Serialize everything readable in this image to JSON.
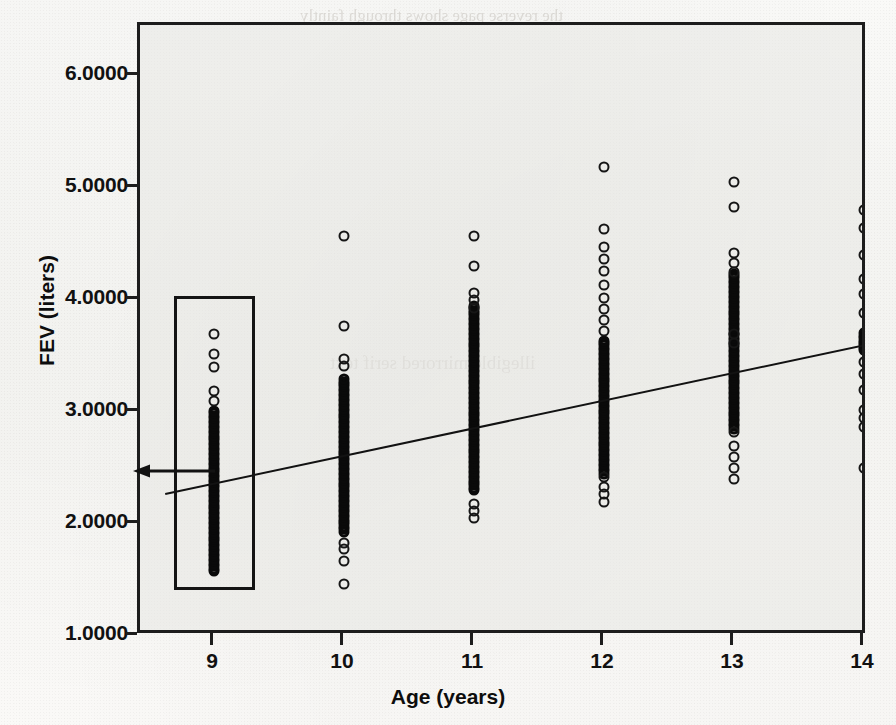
{
  "figure": {
    "kind": "scanned-textbook-figure",
    "background_bleed_text": [
      "the reverse page shows through faintly",
      "illegible mirrored serif text"
    ]
  },
  "axes": {
    "y_title": "FEV (liters)",
    "x_title": "Age (years)",
    "y_ticks": [
      "1.0000",
      "2.0000",
      "3.0000",
      "4.0000",
      "5.0000",
      "6.0000"
    ],
    "x_ticks": [
      "9",
      "10",
      "11",
      "12",
      "13",
      "14"
    ]
  },
  "annotation": {
    "box_label": "age-9-highlight-box",
    "arrow_label": "fitted-value-arrow",
    "arrow_points_to_value": "2.45"
  },
  "chart_data": {
    "type": "scatter",
    "title": "",
    "xlabel": "Age (years)",
    "ylabel": "FEV (liters)",
    "xlim": [
      8.55,
      14.45
    ],
    "ylim": [
      1.0,
      6.45
    ],
    "xticks": [
      9,
      10,
      11,
      12,
      13,
      14
    ],
    "yticks": [
      1.0,
      2.0,
      3.0,
      4.0,
      5.0,
      6.0
    ],
    "ytick_labels": [
      "1.0000",
      "2.0000",
      "3.0000",
      "4.0000",
      "5.0000",
      "6.0000"
    ],
    "xtick_labels": [
      "9",
      "10",
      "11",
      "12",
      "13",
      "14"
    ],
    "grid": false,
    "legend": null,
    "marker": "open-circle",
    "note": "Strip plot: FEV values are stacked vertically at each integer age; dense overlapping runs render as solid black bars.",
    "series": [
      {
        "name": "FEV observations",
        "x": [
          9,
          10,
          11,
          12,
          13,
          14
        ],
        "values_by_age": {
          "9": {
            "min": 1.55,
            "max": 3.7,
            "dense_low": 1.58,
            "dense_high": 3.02,
            "isolated": [
              3.7,
              3.52,
              3.4,
              3.19,
              3.1
            ]
          },
          "10": {
            "min": 1.46,
            "max": 4.57,
            "dense_low": 1.93,
            "dense_high": 3.3,
            "isolated": [
              4.57,
              3.77,
              3.47,
              3.41,
              1.83,
              1.78,
              1.67,
              1.46
            ]
          },
          "11": {
            "min": 2.05,
            "max": 4.57,
            "dense_low": 2.3,
            "dense_high": 3.95,
            "isolated": [
              4.57,
              4.3,
              4.06,
              4.0,
              3.93,
              2.18,
              2.12,
              2.05
            ]
          },
          "12": {
            "min": 2.2,
            "max": 5.19,
            "dense_low": 2.45,
            "dense_high": 3.65,
            "isolated": [
              5.19,
              4.63,
              4.47,
              4.37,
              4.26,
              4.13,
              4.02,
              3.92,
              3.82,
              3.72,
              2.42,
              2.33,
              2.27,
              2.2
            ]
          },
          "13": {
            "min": 2.4,
            "max": 5.05,
            "dense_low": 2.85,
            "dense_high": 4.25,
            "isolated": [
              5.05,
              4.83,
              4.42,
              4.33,
              4.25,
              3.7,
              3.62,
              2.82,
              2.7,
              2.6,
              2.5,
              2.4
            ]
          },
          "14": {
            "min": 2.5,
            "max": 4.8,
            "dense_low": 3.55,
            "dense_high": 3.72,
            "isolated": [
              4.8,
              4.64,
              4.4,
              4.19,
              4.05,
              3.88,
              3.45,
              3.34,
              3.2,
              3.02,
              2.95,
              2.87,
              2.5
            ]
          }
        }
      }
    ],
    "regression_line": {
      "name": "fitted least-squares line",
      "x_start": 8.62,
      "y_start": 2.28,
      "x_end": 14.45,
      "y_end": 3.72,
      "fitted_value_at_age_9": 2.45
    }
  }
}
